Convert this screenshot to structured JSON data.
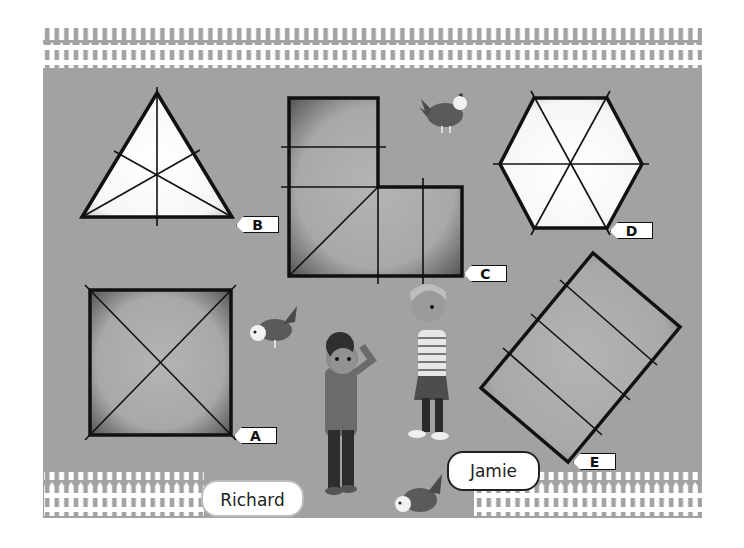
{
  "scene": {
    "description": "Fenced yard with chickens, two children and five labelled shapes with lines drawn across them",
    "colors": {
      "ground": "#a2a2a2",
      "fence": "#ffffff",
      "shape_outline": "#111111"
    }
  },
  "shapes": [
    {
      "label": "A",
      "kind": "square",
      "lines": "2 diagonals"
    },
    {
      "label": "B",
      "kind": "equilateral triangle",
      "lines": "3 lines of symmetry"
    },
    {
      "label": "C",
      "kind": "L-shape",
      "lines": "several straight lines"
    },
    {
      "label": "D",
      "kind": "regular hexagon",
      "lines": "3 lines through centre"
    },
    {
      "label": "E",
      "kind": "rotated rectangle",
      "lines": "3 parallel lines"
    }
  ],
  "characters": [
    {
      "name": "Richard"
    },
    {
      "name": "Jamie"
    }
  ],
  "decorations": [
    "chicken",
    "chicken",
    "chicken"
  ]
}
